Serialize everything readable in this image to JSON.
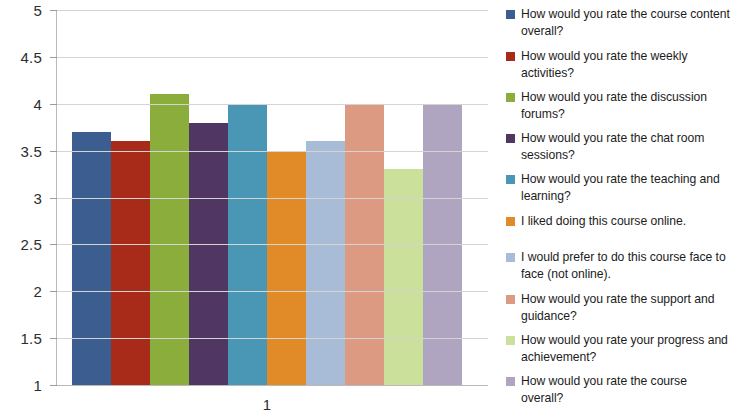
{
  "chart_data": {
    "type": "bar",
    "title": "",
    "subtitle": "",
    "xlabel": "",
    "ylabel": "",
    "categories": [
      "1"
    ],
    "x_tick_labels": [
      "1"
    ],
    "ylim": [
      1,
      5
    ],
    "y_tick_labels": [
      "5",
      "4.5",
      "4",
      "3.5",
      "3",
      "2.5",
      "2",
      "1.5",
      "1"
    ],
    "y_tick_values": [
      5,
      4.5,
      4,
      3.5,
      3,
      2.5,
      2,
      1.5,
      1
    ],
    "grid": true,
    "legend_position": "right",
    "series": [
      {
        "name": "How would you rate the course content overall?",
        "values": [
          3.7
        ],
        "color": "#3b5d8f"
      },
      {
        "name": "How would you rate the weekly activities?",
        "values": [
          3.6
        ],
        "color": "#a82b1a"
      },
      {
        "name": "How would you rate the discussion forums?",
        "values": [
          4.1
        ],
        "color": "#8aad3c"
      },
      {
        "name": "How would you rate the chat room sessions?",
        "values": [
          3.8
        ],
        "color": "#4f3663"
      },
      {
        "name": "How would you rate the teaching and learning?",
        "values": [
          4.0
        ],
        "color": "#4a97b5"
      },
      {
        "name": "I liked doing this course online.",
        "values": [
          3.5
        ],
        "color": "#e08b28"
      },
      {
        "name": "I would prefer to do this course face to face (not online).",
        "values": [
          3.6
        ],
        "color": "#a8bcd8"
      },
      {
        "name": "How would you rate the support and guidance?",
        "values": [
          4.0
        ],
        "color": "#dd9a83"
      },
      {
        "name": "How would you rate your progress and achievement?",
        "values": [
          3.3
        ],
        "color": "#cbe09a"
      },
      {
        "name": "How would you rate the course overall?",
        "values": [
          4.0
        ],
        "color": "#b0a5c0"
      }
    ]
  },
  "legend": {
    "items": [
      {
        "label": "How would you rate the course content overall?",
        "color": "#3b5d8f"
      },
      {
        "label": "How would you rate the weekly activities?",
        "color": "#a82b1a"
      },
      {
        "label": "How would you rate the discussion forums?",
        "color": "#8aad3c"
      },
      {
        "label": "How would you rate the chat room sessions?",
        "color": "#4f3663"
      },
      {
        "label": "How would you rate the teaching and learning?",
        "color": "#4a97b5"
      },
      {
        "label": "I liked doing this course online.",
        "color": "#e08b28"
      },
      {
        "label": "I would prefer to do this course face to face (not online).",
        "color": "#a8bcd8"
      },
      {
        "label": "How would you rate the support and guidance?",
        "color": "#dd9a83"
      },
      {
        "label": "How would you rate your progress and achievement?",
        "color": "#cbe09a"
      },
      {
        "label": "How would you rate the course overall?",
        "color": "#b0a5c0"
      }
    ]
  },
  "colors": {
    "gridline": "#d4d4d4",
    "axis": "#b9b9b9",
    "text": "#1c1c1c",
    "background": "#ffffff"
  }
}
